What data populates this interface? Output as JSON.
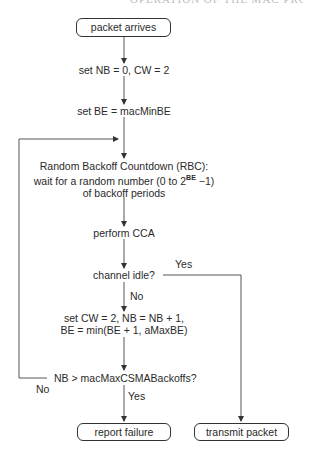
{
  "header": {
    "clipped_title": "OPERATION OF THE MAC PROTOCOL"
  },
  "flowchart": {
    "start": "packet arrives",
    "step1": "set NB = 0, CW = 2",
    "step2": "set BE = macMinBE",
    "rbc": {
      "line1": "Random Backoff Countdown (RBC):",
      "line2_prefix": "wait for a random number (0 to 2",
      "line2_sup": "BE",
      "line2_suffix": " −1)",
      "line3": "of backoff periods"
    },
    "cca": "perform CCA",
    "decision1": "channel idle?",
    "decision1_yes": "Yes",
    "decision1_no": "No",
    "step3_line1": "set CW = 2, NB = NB + 1,",
    "step3_line2": "BE = min(BE + 1, aMaxBE)",
    "decision2": "NB > macMaxCSMABackoffs?",
    "decision2_yes": "Yes",
    "decision2_no": "No",
    "end_failure": "report failure",
    "end_success": "transmit packet"
  }
}
